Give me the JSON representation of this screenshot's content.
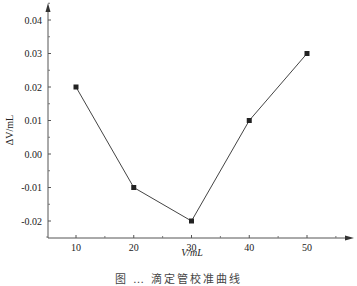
{
  "chart_data": {
    "type": "line",
    "title": "",
    "xlabel": "V/mL",
    "ylabel": "ΔV/mL",
    "x": [
      10,
      20,
      30,
      40,
      50
    ],
    "series": [
      {
        "name": "ΔV",
        "values": [
          0.02,
          -0.01,
          -0.02,
          0.01,
          0.03
        ],
        "marker": "square",
        "color": "#222222"
      }
    ],
    "x_ticks": [
      10,
      20,
      30,
      40,
      50
    ],
    "y_ticks": [
      "0.04",
      "0.03",
      "0.02",
      "0.01",
      "0.00",
      "-0.01",
      "-0.02"
    ],
    "xlim": [
      5,
      56
    ],
    "ylim": [
      -0.025,
      0.045
    ],
    "grid": false,
    "legend": "none"
  },
  "caption": "图 … 滴定管校准曲线"
}
